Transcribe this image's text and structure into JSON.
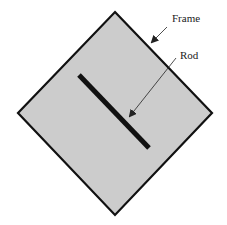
{
  "diagram": {
    "labels": {
      "frame": "Frame",
      "rod": "Rod"
    },
    "colors": {
      "frame_fill": "#cccccc",
      "frame_stroke": "#111111",
      "rod": "#111111"
    }
  }
}
